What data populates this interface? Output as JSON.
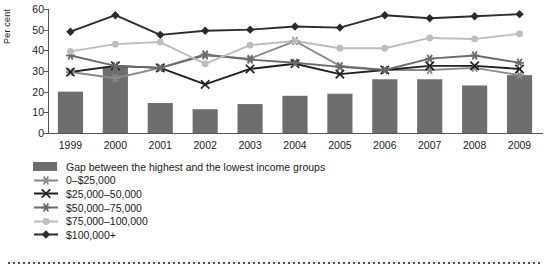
{
  "chart_data": {
    "type": "bar",
    "title": "",
    "xlabel": "",
    "ylabel": "Per cent",
    "ylim": [
      0,
      60
    ],
    "ytick_step": 10,
    "yticks": [
      60,
      50,
      40,
      30,
      20,
      10,
      0
    ],
    "grid": false,
    "legend_position": "below",
    "categories": [
      "1999",
      "2000",
      "2001",
      "2002",
      "2003",
      "2004",
      "2005",
      "2006",
      "2007",
      "2008",
      "2009"
    ],
    "series": [
      {
        "name": "Gap between the highest and the lowest income groups",
        "type": "bar",
        "color": "#6e6e6e",
        "marker": "bar",
        "values": [
          20,
          32,
          14.5,
          11.5,
          14,
          18,
          19,
          26,
          26,
          23,
          28
        ]
      },
      {
        "name": "0–$25,000",
        "type": "line",
        "color": "#8a8a8a",
        "marker": "asterisk",
        "values": [
          29.5,
          26.5,
          31.5,
          37.5,
          36,
          44.5,
          32.5,
          30.5,
          30.5,
          31.5,
          28
        ]
      },
      {
        "name": "$25,000–50,000",
        "type": "line",
        "color": "#1f1f1f",
        "marker": "x",
        "values": [
          29.5,
          32.5,
          31.5,
          23.5,
          31,
          33.5,
          28.5,
          30.5,
          32.5,
          32.5,
          31
        ]
      },
      {
        "name": "$50,000–75,000",
        "type": "line",
        "color": "#6b6b6b",
        "marker": "asterisk",
        "values": [
          37.5,
          32.5,
          31.5,
          38,
          35.5,
          34,
          32,
          30.5,
          36,
          37.5,
          34
        ]
      },
      {
        "name": "$75,000–100,000",
        "type": "line",
        "color": "#bdbdbd",
        "marker": "circle",
        "values": [
          39.5,
          43,
          44,
          33.5,
          42.5,
          44.5,
          41,
          41,
          46,
          45.5,
          48
        ]
      },
      {
        "name": "$100,000+",
        "type": "line",
        "color": "#2b2b2b",
        "marker": "diamond",
        "values": [
          49,
          57,
          47.5,
          49.5,
          50,
          51.5,
          51,
          57,
          55.5,
          56.5,
          57.5
        ]
      }
    ]
  },
  "axis": {
    "ylabel": "Per cent",
    "yticks": [
      "60",
      "50",
      "40",
      "30",
      "20",
      "10",
      "0"
    ],
    "xticks": [
      "1999",
      "2000",
      "2001",
      "2002",
      "2003",
      "2004",
      "2005",
      "2006",
      "2007",
      "2008",
      "2009"
    ]
  },
  "legend": {
    "items": [
      {
        "label": "Gap between the highest and the lowest income groups",
        "marker": "bar",
        "color": "#6e6e6e"
      },
      {
        "label": "0–$25,000",
        "marker": "asterisk",
        "color": "#8a8a8a"
      },
      {
        "label": "$25,000–50,000",
        "marker": "x",
        "color": "#1f1f1f"
      },
      {
        "label": "$50,000–75,000",
        "marker": "asterisk",
        "color": "#6b6b6b"
      },
      {
        "label": "$75,000–100,000",
        "marker": "circle",
        "color": "#bdbdbd"
      },
      {
        "label": "$100,000+",
        "marker": "diamond",
        "color": "#2b2b2b"
      }
    ]
  }
}
